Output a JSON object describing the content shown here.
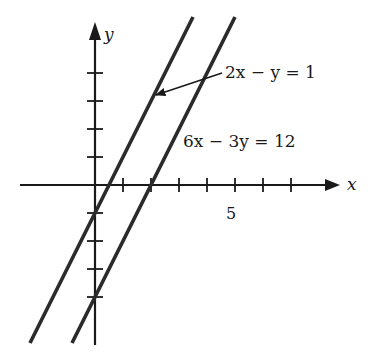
{
  "axes": {
    "x_label": "x",
    "y_label": "y",
    "x_tick_label": "5",
    "origin_px": [
      95,
      185
    ],
    "unit_px": 28,
    "x_ticks": [
      1,
      2,
      3,
      4,
      5,
      6,
      7
    ],
    "y_ticks": [
      1,
      2,
      3,
      4,
      -1,
      -2,
      -3,
      -4
    ]
  },
  "lines": [
    {
      "name": "line-2x-y-1",
      "equation": "2x − y = 1",
      "slope": 2,
      "intercept": -1,
      "color": "#2a2a2a"
    },
    {
      "name": "line-6x-3y-12",
      "equation": "6x − 3y = 12",
      "slope": 2,
      "intercept": -4,
      "color": "#2a2a2a"
    }
  ],
  "labels": {
    "eq1": "2x − y = 1",
    "eq2": "6x − 3y = 12"
  }
}
